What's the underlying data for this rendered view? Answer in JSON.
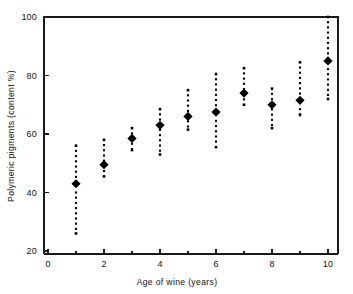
{
  "chart_data": {
    "type": "scatter",
    "title": "",
    "xlabel": "Age of wine (years)",
    "ylabel": "Polymeric pigments (content %)",
    "xlim": [
      0,
      10.5
    ],
    "ylim": [
      20,
      102
    ],
    "grid": false,
    "legend": null,
    "x_ticks": [
      0,
      2,
      4,
      6,
      8,
      10
    ],
    "x_tick_labels": [
      "0",
      "2",
      "4",
      "6",
      "8",
      "10"
    ],
    "x_minor_ticks": [
      1,
      3,
      5,
      7,
      9
    ],
    "y_ticks": [
      20,
      40,
      60,
      80,
      100
    ],
    "y_tick_labels": [
      "20",
      "40",
      "60",
      "80",
      "100"
    ],
    "x": [
      1,
      2,
      3,
      4,
      5,
      6,
      7,
      8,
      9,
      10
    ],
    "values": [
      43,
      49.5,
      58.5,
      63,
      66,
      67.5,
      74,
      70,
      71.5,
      85
    ],
    "error_low": [
      26,
      45.5,
      54.5,
      53,
      61.5,
      55.5,
      70,
      62,
      66.5,
      72
    ],
    "error_high": [
      56,
      58,
      62,
      68.5,
      75,
      80.5,
      82.5,
      75.5,
      84.5,
      100
    ],
    "series": [
      {
        "name": "Polymeric pigments",
        "marker": "diamond",
        "errorbar_style": "dotted",
        "points": [
          {
            "x": 1,
            "y": 43,
            "low": 26,
            "high": 56
          },
          {
            "x": 2,
            "y": 49.5,
            "low": 45.5,
            "high": 58
          },
          {
            "x": 3,
            "y": 58.5,
            "low": 54.5,
            "high": 62
          },
          {
            "x": 4,
            "y": 63,
            "low": 53,
            "high": 68.5
          },
          {
            "x": 5,
            "y": 66,
            "low": 61.5,
            "high": 75
          },
          {
            "x": 6,
            "y": 67.5,
            "low": 55.5,
            "high": 80.5
          },
          {
            "x": 7,
            "y": 74,
            "low": 70,
            "high": 82.5
          },
          {
            "x": 8,
            "y": 70,
            "low": 62,
            "high": 75.5
          },
          {
            "x": 9,
            "y": 71.5,
            "low": 66.5,
            "high": 84.5
          },
          {
            "x": 10,
            "y": 85,
            "low": 72,
            "high": 100
          }
        ]
      }
    ]
  },
  "colors": {
    "marker": "#000000",
    "axis": "#1a1a1a",
    "background": "#ffffff"
  }
}
